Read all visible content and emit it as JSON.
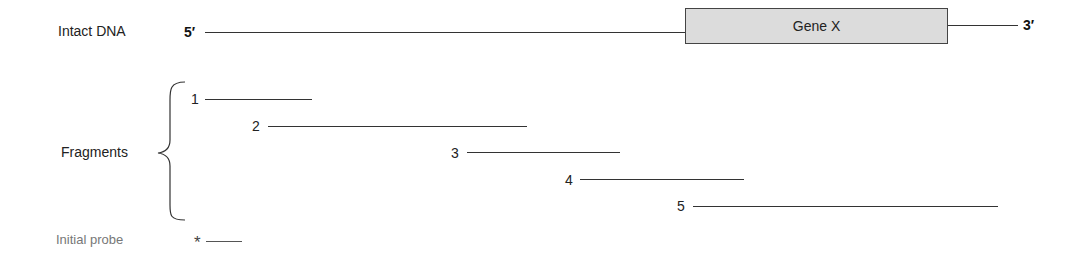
{
  "intact_dna": {
    "label": "Intact DNA",
    "five_prime": "5′",
    "three_prime": "3′",
    "gene_label": "Gene X"
  },
  "fragments": {
    "label": "Fragments",
    "items": [
      {
        "number": "1",
        "x_start": 205,
        "x_end": 312,
        "y": 99
      },
      {
        "number": "2",
        "x_start": 268,
        "x_end": 527,
        "y": 126
      },
      {
        "number": "3",
        "x_start": 467,
        "x_end": 620,
        "y": 153
      },
      {
        "number": "4",
        "x_start": 580,
        "x_end": 744,
        "y": 179
      },
      {
        "number": "5",
        "x_start": 693,
        "x_end": 998,
        "y": 206
      }
    ]
  },
  "probe": {
    "label": "Initial probe",
    "marker": "*"
  },
  "colors": {
    "line": "#333333",
    "gene_box_fill": "#dcdcdc",
    "gene_box_border": "#444444",
    "probe_label": "#777777"
  }
}
